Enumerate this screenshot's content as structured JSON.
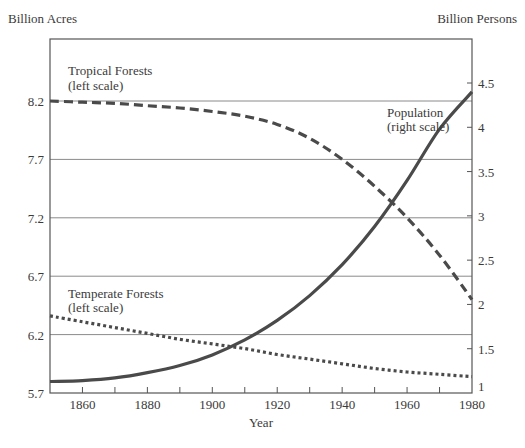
{
  "chart_data": {
    "type": "line",
    "title": "",
    "xlabel": "Year",
    "ylabel_left": "Billion Acres",
    "ylabel_right": "Billion Persons",
    "xlim": [
      1850,
      1980
    ],
    "ylim_left": [
      5.7,
      8.2
    ],
    "ylim_right": [
      1,
      4.5
    ],
    "x_ticks": [
      1860,
      1880,
      1900,
      1920,
      1940,
      1960,
      1980
    ],
    "x_tick_labels": [
      "1860",
      "1880",
      "1900",
      "1920",
      "1940",
      "1960",
      "1980"
    ],
    "y_left_ticks": [
      8.2,
      7.7,
      7.2,
      6.7,
      6.2,
      5.7
    ],
    "y_left_tick_labels": [
      "8.2",
      "7.7",
      "7.2",
      "6.7",
      "6.2",
      "5.7"
    ],
    "y_right_ticks": [
      4.5,
      4,
      3.5,
      3,
      2.5,
      2,
      1.5,
      1
    ],
    "y_right_tick_labels": [
      "4.5",
      "4",
      "3.5",
      "3",
      "2.5",
      "2",
      "1.5",
      "1"
    ],
    "grid": "horizontal at left-scale ticks",
    "x": [
      1850,
      1860,
      1870,
      1880,
      1890,
      1900,
      1910,
      1920,
      1930,
      1940,
      1950,
      1960,
      1970,
      1980
    ],
    "series": [
      {
        "name": "Tropical Forests",
        "label": "Tropical Forests",
        "sublabel": "(left scale)",
        "axis": "left",
        "style": "dashed",
        "values": [
          8.2,
          8.19,
          8.18,
          8.16,
          8.14,
          8.11,
          8.07,
          8.0,
          7.88,
          7.7,
          7.47,
          7.2,
          6.88,
          6.5
        ]
      },
      {
        "name": "Temperate Forests",
        "label": "Temperate Forests",
        "sublabel": "(left scale)",
        "axis": "left",
        "style": "dotted",
        "values": [
          6.36,
          6.31,
          6.26,
          6.21,
          6.16,
          6.12,
          6.08,
          6.03,
          5.99,
          5.95,
          5.91,
          5.88,
          5.86,
          5.84
        ]
      },
      {
        "name": "Population",
        "label": "Population",
        "sublabel": "(right scale)",
        "axis": "right",
        "style": "solid",
        "values": [
          1.13,
          1.14,
          1.17,
          1.23,
          1.31,
          1.43,
          1.6,
          1.82,
          2.1,
          2.45,
          2.88,
          3.4,
          3.98,
          4.4
        ]
      }
    ]
  }
}
